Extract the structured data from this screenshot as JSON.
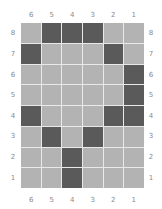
{
  "chart_data": {
    "type": "heatmap",
    "title": "",
    "columns": [
      "6",
      "5",
      "4",
      "3",
      "2",
      "1"
    ],
    "rows": [
      "8",
      "7",
      "6",
      "5",
      "4",
      "3",
      "2",
      "1"
    ],
    "legend": {
      "dark": "filled",
      "light": "empty"
    },
    "colors": {
      "filled": "#5a5a5a",
      "empty": "#b3b3b3",
      "grid_line": "#e9e9e9",
      "label": "#8a8a8a"
    },
    "cells": [
      [
        0,
        1,
        1,
        1,
        0,
        0
      ],
      [
        1,
        0,
        0,
        0,
        1,
        0
      ],
      [
        0,
        0,
        0,
        0,
        0,
        1
      ],
      [
        0,
        0,
        0,
        0,
        0,
        1
      ],
      [
        1,
        0,
        0,
        0,
        1,
        1
      ],
      [
        0,
        1,
        0,
        1,
        0,
        0
      ],
      [
        0,
        0,
        1,
        0,
        0,
        0
      ],
      [
        0,
        0,
        1,
        0,
        0,
        0
      ]
    ],
    "filled_cells": {
      "8": [
        "5",
        "4",
        "3"
      ],
      "7": [
        "6",
        "2"
      ],
      "6": [
        "1"
      ],
      "5": [
        "1"
      ],
      "4": [
        "6",
        "2",
        "1"
      ],
      "3": [
        "5",
        "3"
      ],
      "2": [
        "4"
      ],
      "1": [
        "4"
      ]
    }
  },
  "labels": {
    "top": [
      "6",
      "5",
      "4",
      "3",
      "2",
      "1"
    ],
    "bottom": [
      "6",
      "5",
      "4",
      "3",
      "2",
      "1"
    ],
    "left": [
      "8",
      "7",
      "6",
      "5",
      "4",
      "3",
      "2",
      "1"
    ],
    "right": [
      "8",
      "7",
      "6",
      "5",
      "4",
      "3",
      "2",
      "1"
    ]
  }
}
